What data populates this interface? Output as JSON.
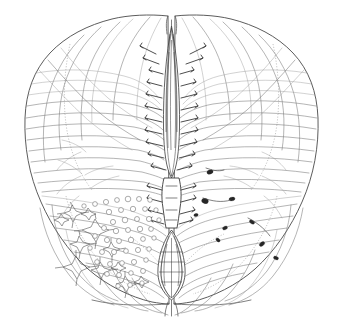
{
  "figure": {
    "kind": "anatomical-line-drawing",
    "medium": "ink line drawing / histological tracing",
    "background_color": "#ffffff",
    "outline_color": "#4a4a4a",
    "fiber_color": "#777777",
    "dark_ink_color": "#2b2b2b",
    "faint_fiber_color": "#9a9a9a",
    "gray_matter_border_color": "#8d8d8d",
    "canvas": {
      "width": 343,
      "height": 328
    }
  },
  "structures": [
    {
      "id": "cord-outline",
      "label": "Spinal cord outer boundary (pia mater)",
      "side": "both"
    },
    {
      "id": "dorsal-median-septum",
      "label": "Dorsal median septum / sulcus",
      "side": "midline"
    },
    {
      "id": "ventral-median-fissure",
      "label": "Ventral (anterior) median fissure",
      "side": "midline"
    },
    {
      "id": "central-canal",
      "label": "Central canal and gray commissure",
      "side": "midline"
    },
    {
      "id": "left-ventral-horn",
      "label": "Left ventral (anterior) horn with motor neurons",
      "side": "left"
    },
    {
      "id": "right-ventral-horn",
      "label": "Right ventral (anterior) horn",
      "side": "right"
    },
    {
      "id": "left-dorsal-horn",
      "label": "Left dorsal (posterior) horn",
      "side": "left"
    },
    {
      "id": "right-dorsal-horn",
      "label": "Right dorsal (posterior) horn",
      "side": "right"
    },
    {
      "id": "white-matter-fibers",
      "label": "Radiating white matter fiber tracts",
      "side": "both"
    },
    {
      "id": "motor-neuron-somata",
      "label": "Multipolar motor neuron cell bodies",
      "side": "left"
    },
    {
      "id": "small-cell-profiles",
      "label": "Small round cell profiles",
      "side": "left"
    },
    {
      "id": "dark-cell-blobs",
      "label": "Dark stained cell clusters",
      "side": "right"
    }
  ],
  "counts": {
    "motor_neuron_somata": 11,
    "small_cell_profiles": 46,
    "dark_cell_blobs": 9,
    "radiating_fibers_left": 34,
    "radiating_fibers_right": 34,
    "commissural_hairs_dorsal": 24,
    "commissural_hairs_ventral": 16
  }
}
